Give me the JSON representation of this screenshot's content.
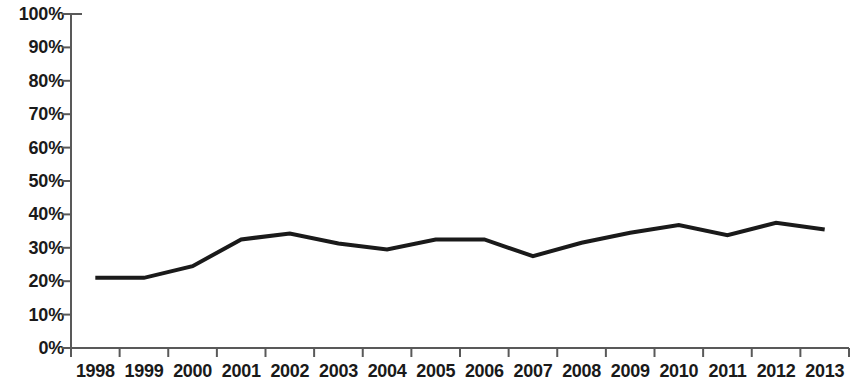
{
  "chart_data": {
    "type": "line",
    "title": "",
    "subtitle": "",
    "xlabel": "",
    "ylabel": "",
    "categories": [
      "1998",
      "1999",
      "2000",
      "2001",
      "2002",
      "2003",
      "2004",
      "2005",
      "2006",
      "2007",
      "2008",
      "2009",
      "2010",
      "2011",
      "2012",
      "2013"
    ],
    "values": [
      21.0,
      21.0,
      24.5,
      32.5,
      34.3,
      31.3,
      29.5,
      32.5,
      32.5,
      27.5,
      31.5,
      34.5,
      36.8,
      33.8,
      37.5,
      35.5
    ],
    "series": [
      {
        "name": "",
        "values": [
          21.0,
          21.0,
          24.5,
          32.5,
          34.3,
          31.3,
          29.5,
          32.5,
          32.5,
          27.5,
          31.5,
          34.5,
          36.8,
          33.8,
          37.5,
          35.5
        ]
      }
    ],
    "ylim": [
      0,
      100
    ],
    "y_tick_values": [
      0,
      10,
      20,
      30,
      40,
      50,
      60,
      70,
      80,
      90,
      100
    ],
    "y_tick_labels": [
      "0%",
      "10%",
      "20%",
      "30%",
      "40%",
      "50%",
      "60%",
      "70%",
      "80%",
      "90%",
      "100%"
    ],
    "x_tick_labels": [
      "1998",
      "1999",
      "2000",
      "2001",
      "2002",
      "2003",
      "2004",
      "2005",
      "2006",
      "2007",
      "2008",
      "2009",
      "2010",
      "2011",
      "2012",
      "2013"
    ],
    "grid": false,
    "legend": null,
    "legend_position": "none",
    "annotations": [],
    "line_color": "#1a1a1a",
    "axis_color": "#595959",
    "background_color": "#ffffff",
    "line_width": 4,
    "markers": false
  },
  "axes": {
    "plot_left": 71,
    "plot_right": 849,
    "plot_top": 14,
    "plot_bottom": 348
  }
}
